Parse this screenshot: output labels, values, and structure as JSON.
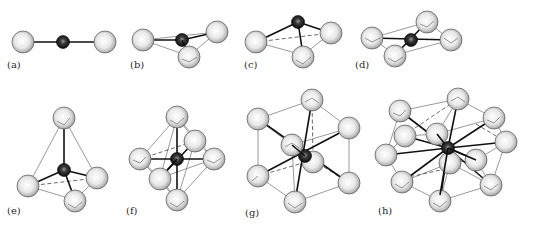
{
  "figure": {
    "colors": {
      "ligand_fill_light": "#ffffff",
      "ligand_fill_dark": "#9a9a9a",
      "central_atom": "#1a1a1a",
      "bond": "#111111",
      "edge": "#555555"
    },
    "panels": [
      {
        "id": "a",
        "label": "(a)",
        "geometry": "linear",
        "coordination_number": 2
      },
      {
        "id": "b",
        "label": "(b)",
        "geometry": "trigonal planar",
        "coordination_number": 3
      },
      {
        "id": "c",
        "label": "(c)",
        "geometry": "trigonal pyramidal",
        "coordination_number": 3
      },
      {
        "id": "d",
        "label": "(d)",
        "geometry": "square planar",
        "coordination_number": 4
      },
      {
        "id": "e",
        "label": "(e)",
        "geometry": "tetrahedral",
        "coordination_number": 4
      },
      {
        "id": "f",
        "label": "(f)",
        "geometry": "octahedral",
        "coordination_number": 6
      },
      {
        "id": "g",
        "label": "(g)",
        "geometry": "cubic",
        "coordination_number": 8
      },
      {
        "id": "h",
        "label": "(h)",
        "geometry": "cuboctahedral",
        "coordination_number": 12
      }
    ]
  }
}
